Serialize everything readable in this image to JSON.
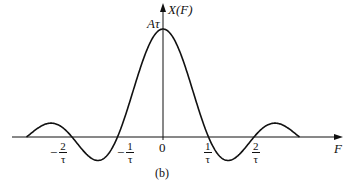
{
  "chart_data": {
    "type": "line",
    "title": "",
    "caption": "(b)",
    "xlabel": "F",
    "ylabel": "X(F)",
    "function": "X(F) = A·τ·sinc(F·τ) = Aτ·sin(πFτ)/(πFτ)",
    "peak_label": "Aτ",
    "x_ticks": [
      {
        "value": -2,
        "label": "−2/τ",
        "neg": "−",
        "num": "2",
        "den": "τ"
      },
      {
        "value": -1,
        "label": "−1/τ",
        "neg": "−",
        "num": "1",
        "den": "τ"
      },
      {
        "value": 0,
        "label": "0"
      },
      {
        "value": 1,
        "label": "1/τ",
        "neg": "",
        "num": "1",
        "den": "τ"
      },
      {
        "value": 2,
        "label": "2/τ",
        "neg": "",
        "num": "2",
        "den": "τ"
      }
    ],
    "x_units": "1/τ",
    "xlim": [
      -3.0,
      3.0
    ],
    "ylim": [
      -0.3,
      1.2
    ],
    "peak": {
      "x": 0,
      "y": 1.0
    },
    "zero_crossings": [
      -2,
      -1,
      1,
      2
    ],
    "sidelobes": [
      {
        "x": -2.46,
        "y": 0.128
      },
      {
        "x": -1.43,
        "y": -0.217
      },
      {
        "x": 1.43,
        "y": -0.217
      },
      {
        "x": 2.46,
        "y": 0.128
      }
    ],
    "grid": false,
    "legend": "none"
  },
  "axes": {
    "y_label": "X(F)",
    "x_label": "F",
    "origin_label": "0",
    "peak_label": "Aτ"
  },
  "caption": "(b)",
  "colors": {
    "line": "#111111",
    "background": "#ffffff"
  }
}
